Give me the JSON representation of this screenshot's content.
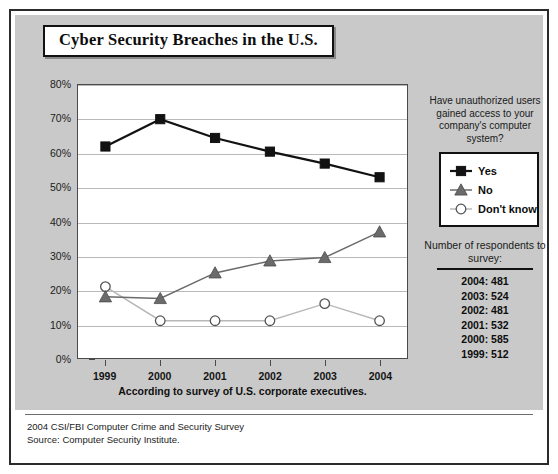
{
  "title": "Cyber Security Breaches in the U.S.",
  "question": "Have unauthorized users gained access to your company's computer system?",
  "caption": "According to survey of U.S. corporate executives.",
  "footer": {
    "line1": "2004 CSI/FBI Computer Crime and Security Survey",
    "line2": "Source: Computer Security Institute."
  },
  "respondents": {
    "heading": "Number of respondents to survey:",
    "rows": [
      "2004: 481",
      "2003: 524",
      "2002: 481",
      "2001: 532",
      "2000: 585",
      "1999: 512"
    ]
  },
  "colors": {
    "panel_background": "#c9c9c9",
    "plot_background": "#ffffff",
    "gridline": "#b9b9b9",
    "yes_series": "#121212",
    "no_series": "#6b6b6b",
    "dont_know_series": "#b0b0b0",
    "frame": "#2b2b2b"
  },
  "chart_data": {
    "type": "line",
    "title": "Cyber Security Breaches in the U.S.",
    "subtitle": "Have unauthorized users gained access to your company's computer system?",
    "xlabel": "",
    "ylabel": "",
    "categories": [
      "1999",
      "2000",
      "2001",
      "2002",
      "2003",
      "2004"
    ],
    "ylim": [
      0,
      80
    ],
    "ytick_labels": [
      "0%",
      "10%",
      "20%",
      "30%",
      "40%",
      "50%",
      "60%",
      "70%",
      "80%"
    ],
    "yticks": [
      0,
      10,
      20,
      30,
      40,
      50,
      60,
      70,
      80
    ],
    "grid": true,
    "legend_position": "right",
    "series": [
      {
        "name": "Yes",
        "marker": "square",
        "color": "#121212",
        "values": [
          62,
          70,
          64.5,
          60.5,
          57,
          53
        ]
      },
      {
        "name": "No",
        "marker": "triangle",
        "color": "#6b6b6b",
        "values": [
          18,
          17.5,
          25,
          28.5,
          29.5,
          37
        ]
      },
      {
        "name": "Don't know",
        "marker": "circle-open",
        "color": "#b0b0b0",
        "values": [
          21,
          11,
          11,
          11,
          16,
          11
        ]
      }
    ],
    "annotations": [
      "According to survey of U.S. corporate executives.",
      "Number of respondents to survey: 2004: 481, 2003: 524, 2002: 481, 2001: 532, 2000: 585, 1999: 512"
    ]
  }
}
